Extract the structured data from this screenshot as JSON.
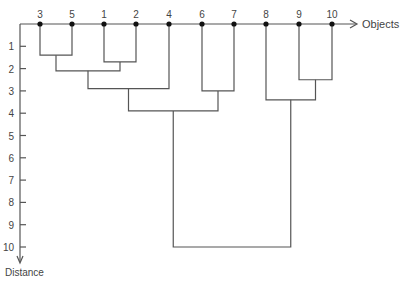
{
  "chart_data": {
    "type": "dendrogram",
    "title": "",
    "xlabel": "Objects",
    "ylabel": "Distance",
    "leaf_order": [
      "3",
      "5",
      "1",
      "2",
      "4",
      "6",
      "7",
      "8",
      "9",
      "10"
    ],
    "y_ticks": [
      "1",
      "2",
      "3",
      "4",
      "5",
      "6",
      "7",
      "8",
      "9",
      "10"
    ],
    "ylim": [
      0,
      10
    ],
    "merges": [
      {
        "left": "3",
        "right": "5",
        "distance": 1.4
      },
      {
        "left": "1",
        "right": "2",
        "distance": 1.7
      },
      {
        "left": "(3,5)",
        "right": "(1,2)",
        "distance": 2.1
      },
      {
        "left": "9",
        "right": "10",
        "distance": 2.5
      },
      {
        "left": "(3,5,1,2)",
        "right": "4",
        "distance": 2.9
      },
      {
        "left": "6",
        "right": "7",
        "distance": 3.0
      },
      {
        "left": "8",
        "right": "(9,10)",
        "distance": 3.4
      },
      {
        "left": "(3,5,1,2,4)",
        "right": "(6,7)",
        "distance": 3.9
      },
      {
        "left": "(3,5,1,2,4,6,7)",
        "right": "(8,9,10)",
        "distance": 10.0
      }
    ]
  },
  "labels": {
    "x_axis": "Objects",
    "y_axis": "Distance"
  },
  "colors": {
    "line": "#555555",
    "node": "#111111",
    "text": "#444444"
  }
}
